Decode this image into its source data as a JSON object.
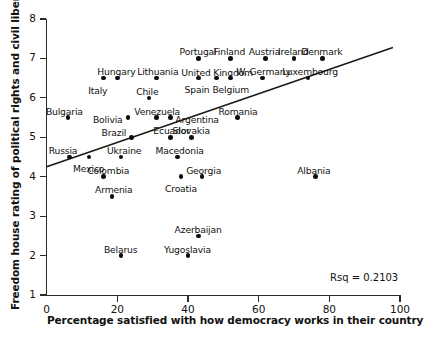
{
  "chart_data": {
    "type": "scatter",
    "title": "",
    "xlabel": "Percentage satisfied with how democracy works in their country",
    "ylabel": "Freedom house rating of political rights and civil liberties",
    "xlim": [
      0,
      100
    ],
    "ylim": [
      1,
      8
    ],
    "xticks": [
      0,
      20,
      40,
      60,
      80,
      100
    ],
    "yticks": [
      1,
      2,
      3,
      4,
      5,
      6,
      7,
      8
    ],
    "grid": false,
    "legend": null,
    "annotation": "Rsq = 0.2103",
    "trendline": {
      "type": "linear",
      "x_start": 0,
      "y_start": 4.25,
      "x_end": 98,
      "y_end": 7.28
    },
    "points": [
      {
        "label": "Bulgaria",
        "x": 6,
        "y": 5.5,
        "label_dx": -22,
        "label_dy": -12
      },
      {
        "label": "Russia",
        "x": 6.5,
        "y": 4.5,
        "label_dx": -21,
        "label_dy": -12
      },
      {
        "label": "Mexico",
        "x": 12,
        "y": 4.5,
        "label_dx": -16,
        "label_dy": 6
      },
      {
        "label": "Colombia",
        "x": 16,
        "y": 4.0,
        "label_dx": -16,
        "label_dy": -12
      },
      {
        "label": "Italy",
        "x": 16,
        "y": 6.5,
        "label_dx": -15,
        "label_dy": 7
      },
      {
        "label": "Hungary",
        "x": 20,
        "y": 6.5,
        "label_dx": -20,
        "label_dy": -12
      },
      {
        "label": "Armenia",
        "x": 18.5,
        "y": 3.5,
        "label_dx": -17,
        "label_dy": -12
      },
      {
        "label": "Bolivia",
        "x": 23,
        "y": 5.5,
        "label_dx": -35,
        "label_dy": -4
      },
      {
        "label": "Brazil",
        "x": 24,
        "y": 5.0,
        "label_dx": -30,
        "label_dy": -10
      },
      {
        "label": "Ukraine",
        "x": 21,
        "y": 4.5,
        "label_dx": -14,
        "label_dy": -12
      },
      {
        "label": "Belarus",
        "x": 21,
        "y": 2.0,
        "label_dx": -17,
        "label_dy": -12
      },
      {
        "label": "Chile",
        "x": 29,
        "y": 6.0,
        "label_dx": -13,
        "label_dy": -12
      },
      {
        "label": "Lithuania",
        "x": 31,
        "y": 6.5,
        "label_dx": -19,
        "label_dy": -12
      },
      {
        "label": "Venezuela",
        "x": 31,
        "y": 5.5,
        "label_dx": -22,
        "label_dy": -12
      },
      {
        "label": "Ecuador",
        "x": 35,
        "y": 5.0,
        "label_dx": -17,
        "label_dy": -12
      },
      {
        "label": "Argentina",
        "x": 35,
        "y": 5.5,
        "label_dx": 5,
        "label_dy": -4
      },
      {
        "label": "Macedonia",
        "x": 37,
        "y": 4.5,
        "label_dx": -22,
        "label_dy": -12
      },
      {
        "label": "Croatia",
        "x": 38,
        "y": 4.0,
        "label_dx": -16,
        "label_dy": 6
      },
      {
        "label": "Georgia",
        "x": 44,
        "y": 4.0,
        "label_dx": -16,
        "label_dy": -12
      },
      {
        "label": "Slovakia",
        "x": 41,
        "y": 5.0,
        "label_dx": -19,
        "label_dy": -12
      },
      {
        "label": "Yugoslavia",
        "x": 40,
        "y": 2.0,
        "label_dx": -24,
        "label_dy": -12
      },
      {
        "label": "Azerbaijan",
        "x": 43,
        "y": 2.5,
        "label_dx": -24,
        "label_dy": -12
      },
      {
        "label": "Portugal",
        "x": 43,
        "y": 7.0,
        "label_dx": -19,
        "label_dy": -12
      },
      {
        "label": "Spain",
        "x": 43,
        "y": 6.5,
        "label_dx": -14,
        "label_dy": 6
      },
      {
        "label": "United Kingdom",
        "x": 48,
        "y": 6.5,
        "label_dx": -35,
        "label_dy": -11
      },
      {
        "label": "Finland",
        "x": 52,
        "y": 7.0,
        "label_dx": -17,
        "label_dy": -12
      },
      {
        "label": "Belgium",
        "x": 52,
        "y": 6.5,
        "label_dx": -18,
        "label_dy": 6
      },
      {
        "label": "Romania",
        "x": 54,
        "y": 5.5,
        "label_dx": -19,
        "label_dy": -12
      },
      {
        "label": "Austria",
        "x": 62,
        "y": 7.0,
        "label_dx": -17,
        "label_dy": -12
      },
      {
        "label": "W. Germany",
        "x": 61,
        "y": 6.5,
        "label_dx": -26,
        "label_dy": -12
      },
      {
        "label": "Ireland",
        "x": 70,
        "y": 7.0,
        "label_dx": -16,
        "label_dy": -12
      },
      {
        "label": "Luxembourg",
        "x": 74,
        "y": 6.5,
        "label_dx": -26,
        "label_dy": -12
      },
      {
        "label": "Denmark",
        "x": 78,
        "y": 7.0,
        "label_dx": -21,
        "label_dy": -12
      },
      {
        "label": "Albania",
        "x": 76,
        "y": 4.0,
        "label_dx": -18,
        "label_dy": -12
      }
    ]
  }
}
